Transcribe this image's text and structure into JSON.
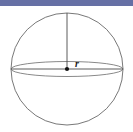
{
  "figure": {
    "name": "sphere-radius-diagram",
    "width": 133,
    "height": 132,
    "background_color": "#ffffff"
  },
  "banner": {
    "name": "top-banner",
    "color": "#6670a5",
    "height": 6
  },
  "colors": {
    "outline": "#555555",
    "equator": "#6b6b6b",
    "radius_line": "#4a4a4a",
    "center_dot": "#111111",
    "label_text": "#1a1a1a"
  },
  "geometry": {
    "sphere": {
      "center_x": 67,
      "center_y": 69,
      "radius": 56,
      "stroke_width": 0.8
    },
    "equator_ellipse": {
      "center_x": 67,
      "center_y": 69,
      "rx": 56,
      "ry": 7.5,
      "stroke_width": 0.8
    },
    "vertical_radius": {
      "x1": 67,
      "y1": 13,
      "x2": 67,
      "y2": 69,
      "stroke_width": 0.9
    },
    "horizontal_radius": {
      "x1": 11,
      "y1": 69,
      "x2": 123,
      "y2": 69,
      "stroke_width": 0.9
    },
    "center_dot": {
      "cx": 67,
      "cy": 69,
      "r": 2.1
    }
  },
  "labels": {
    "radius": {
      "text": "r",
      "x": 75,
      "y": 59
    }
  }
}
